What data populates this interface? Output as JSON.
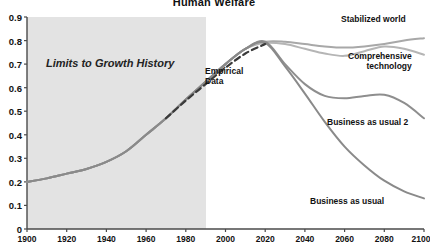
{
  "chart": {
    "title": "Human Welfare",
    "annotations": {
      "history": "Limits to Growth History",
      "empirical_line1": "Empirical",
      "empirical_line2": "Data",
      "stabilized": "Stabilized world",
      "comprehensive_line1": "Comprehensive",
      "comprehensive_line2": "technology",
      "business_as_usual_2": "Business as usual 2",
      "business_as_usual": "Business as usual"
    }
  },
  "chart_data": {
    "type": "line",
    "title": "Human Welfare",
    "xlabel": "",
    "ylabel": "",
    "xlim": [
      1900,
      2100
    ],
    "ylim": [
      0,
      0.9
    ],
    "grid": false,
    "legend_position": "inline-right-labels",
    "x_ticks": [
      1900,
      1920,
      1940,
      1960,
      1980,
      2000,
      2020,
      2040,
      2060,
      2080,
      2100
    ],
    "y_ticks": [
      "0",
      "0.1",
      "0.2",
      "0.3",
      "0.4",
      "0.5",
      "0.6",
      "0.7",
      "0.8",
      "0.9"
    ],
    "shaded_region": {
      "label": "Limits to Growth History",
      "x_start": 1900,
      "x_end": 1990,
      "color": "#e3e3e3"
    },
    "x": [
      1900,
      1910,
      1920,
      1930,
      1940,
      1950,
      1960,
      1970,
      1980,
      1990,
      2000,
      2010,
      2020,
      2030,
      2040,
      2050,
      2060,
      2070,
      2080,
      2090,
      2100
    ],
    "series": [
      {
        "name": "Stabilized world",
        "color": "#a8a8a8",
        "style": "solid",
        "values": [
          0.2,
          0.215,
          0.235,
          0.255,
          0.285,
          0.33,
          0.4,
          0.47,
          0.55,
          0.625,
          0.7,
          0.765,
          0.795,
          0.795,
          0.785,
          0.775,
          0.77,
          0.775,
          0.785,
          0.8,
          0.81
        ]
      },
      {
        "name": "Comprehensive technology",
        "color": "#b5b5b5",
        "style": "solid",
        "values": [
          0.2,
          0.215,
          0.235,
          0.255,
          0.285,
          0.33,
          0.4,
          0.47,
          0.55,
          0.625,
          0.7,
          0.765,
          0.79,
          0.785,
          0.765,
          0.745,
          0.735,
          0.755,
          0.775,
          0.765,
          0.74
        ]
      },
      {
        "name": "Business as usual 2",
        "color": "#8e8e8e",
        "style": "solid",
        "values": [
          0.2,
          0.215,
          0.235,
          0.255,
          0.285,
          0.33,
          0.4,
          0.47,
          0.55,
          0.625,
          0.7,
          0.765,
          0.795,
          0.7,
          0.615,
          0.565,
          0.555,
          0.565,
          0.57,
          0.535,
          0.47
        ]
      },
      {
        "name": "Business as usual",
        "color": "#8a8a8a",
        "style": "solid",
        "values": [
          0.2,
          0.215,
          0.235,
          0.255,
          0.285,
          0.33,
          0.4,
          0.47,
          0.55,
          0.625,
          0.7,
          0.765,
          0.79,
          0.69,
          0.575,
          0.455,
          0.35,
          0.27,
          0.205,
          0.16,
          0.13
        ]
      },
      {
        "name": "Empirical Data",
        "color": "#3a3a3a",
        "style": "dashed",
        "x": [
          1970,
          1980,
          1990,
          2000,
          2010,
          2020
        ],
        "values": [
          0.47,
          0.545,
          0.615,
          0.685,
          0.745,
          0.785
        ]
      }
    ]
  }
}
